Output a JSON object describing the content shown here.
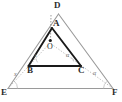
{
  "figure": {
    "kind": "geometry-diagram",
    "canvas": {
      "width": 122,
      "height": 102
    },
    "colors": {
      "background": "#ffffff",
      "outer_triangle_stroke": "#9a9a9a",
      "inner_triangle_stroke": "#1a1a1a",
      "construction_line": "#b0b0b0",
      "label_text": "#2b2b2b",
      "angle_label_text": "#6f6f6f",
      "point_fill": "#1a1a1a"
    },
    "vertices": [
      {
        "id": "D",
        "label": "D",
        "x": 58.5,
        "y": 14.0,
        "label_x": 54.0,
        "label_y": 1.0
      },
      {
        "id": "E",
        "label": "E",
        "x": 8.0,
        "y": 88.5,
        "label_x": 1.0,
        "label_y": 88.0
      },
      {
        "id": "F",
        "label": "F",
        "x": 113.0,
        "y": 88.5,
        "label_x": 112.0,
        "label_y": 88.0
      },
      {
        "id": "A",
        "label": "A",
        "x": 52.0,
        "y": 28.0,
        "label_x": 53.0,
        "label_y": 19.0
      },
      {
        "id": "B",
        "label": "B",
        "x": 28.5,
        "y": 66.0,
        "label_x": 27.0,
        "label_y": 66.5
      },
      {
        "id": "C",
        "label": "C",
        "x": 81.0,
        "y": 66.0,
        "label_x": 78.0,
        "label_y": 66.5
      },
      {
        "id": "O",
        "label": "O",
        "x": 50.0,
        "y": 45.0,
        "label_x": 47.0,
        "label_y": 46.0
      }
    ],
    "edges": [
      {
        "id": "DE",
        "from": "D",
        "to": "E",
        "style": "solid",
        "weight": "thin",
        "group": "outer"
      },
      {
        "id": "DF",
        "from": "D",
        "to": "F",
        "style": "solid",
        "weight": "thin",
        "group": "outer"
      },
      {
        "id": "EF",
        "from": "E",
        "to": "F",
        "style": "solid",
        "weight": "thin",
        "group": "outer"
      },
      {
        "id": "AB",
        "from": "A",
        "to": "B",
        "style": "solid",
        "weight": "thick",
        "group": "inner"
      },
      {
        "id": "AC",
        "from": "A",
        "to": "C",
        "style": "solid",
        "weight": "thick",
        "group": "inner"
      },
      {
        "id": "BC",
        "from": "B",
        "to": "C",
        "style": "solid",
        "weight": "thick",
        "group": "inner"
      }
    ],
    "construction_lines": [
      {
        "id": "EO",
        "from": "E",
        "to": "O",
        "style": "dotted"
      },
      {
        "id": "FO",
        "from": "F",
        "to": "O",
        "style": "dotted"
      },
      {
        "id": "DO",
        "from": "D",
        "to": "O",
        "style": "dotted",
        "note": "vertical through A"
      }
    ],
    "angle_marks": [
      {
        "id": "angle-E",
        "label": "x",
        "at": "E",
        "label_x": 14.0,
        "label_y": 71.0
      },
      {
        "id": "angle-B",
        "label": "x",
        "at": "B",
        "label_x": 34.0,
        "label_y": 52.0
      },
      {
        "id": "angle-C",
        "label": "α",
        "at": "C",
        "label_x": 66.0,
        "label_y": 52.0
      },
      {
        "id": "angle-F",
        "label": "α",
        "at": "F",
        "label_x": 93.0,
        "label_y": 70.0
      }
    ],
    "points": [
      {
        "id": "point-O",
        "x": 50.0,
        "y": 40.5,
        "r": 1.6
      }
    ]
  }
}
